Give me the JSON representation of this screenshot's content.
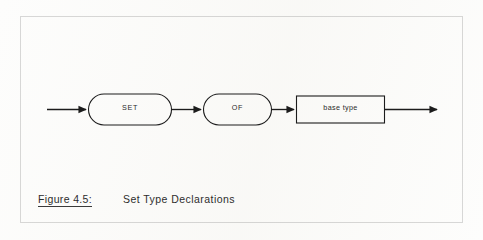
{
  "figure": {
    "caption_number": "Figure 4.5:",
    "caption_title": "Set Type Declarations",
    "frame": {
      "stroke_color": "#6f6f6f"
    }
  },
  "diagram": {
    "type": "railroad-syntax-diagram",
    "background_color": "#fdfdfc",
    "line_color": "#1c1c1c",
    "nodes": [
      {
        "id": "set",
        "shape": "stadium",
        "label": "SET"
      },
      {
        "id": "of",
        "shape": "stadium",
        "label": "OF"
      },
      {
        "id": "base_type",
        "shape": "rectangle",
        "label": "base type"
      }
    ],
    "connectors": [
      {
        "id": "entry",
        "from": "start",
        "to": "set",
        "arrowhead": true
      },
      {
        "id": "set-to-of",
        "from": "set",
        "to": "of",
        "arrowhead": true
      },
      {
        "id": "of-to-base",
        "from": "of",
        "to": "base_type",
        "arrowhead": true
      },
      {
        "id": "exit",
        "from": "base_type",
        "to": "end",
        "arrowhead": true
      }
    ]
  }
}
